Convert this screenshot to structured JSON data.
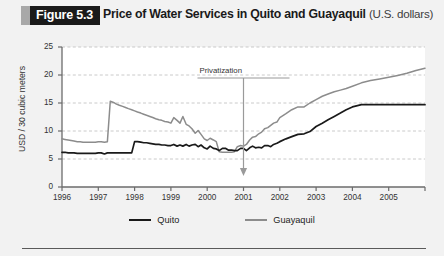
{
  "figure": {
    "tag": "Figure 5.3",
    "title": "Price of Water Services in Quito and Guayaquil",
    "title_units": "(U.S. dollars)"
  },
  "colors": {
    "quito": "#1a1a1a",
    "guayaquil": "#8c8c8c",
    "grid": "#bdbdbd",
    "axis": "#6b6b6b",
    "plot_background": "#ffffff",
    "figure_background": "#f2f2f2",
    "tag_background": "#1a1a1a",
    "tag_accent": "#a8a8a8"
  },
  "legend": {
    "position": "bottom-center",
    "items": [
      {
        "label": "Quito",
        "color": "#1a1a1a"
      },
      {
        "label": "Guayaquil",
        "color": "#8c8c8c"
      }
    ]
  },
  "annotations": [
    {
      "text": "Privatization",
      "x": 2001.0,
      "arrow": "down"
    }
  ],
  "chart_data": {
    "type": "line",
    "title": "Price of Water Services in Quito and Guayaquil (U.S. dollars)",
    "xlabel": "",
    "ylabel": "USD / 30 cubic meters",
    "xlim": [
      1996,
      2006
    ],
    "ylim": [
      0,
      25
    ],
    "yticks": [
      0,
      5,
      10,
      15,
      20,
      25
    ],
    "ytick_labels": [
      "0",
      "5",
      "10",
      "15",
      "20",
      "25"
    ],
    "xticks": [
      1996,
      1997,
      1998,
      1999,
      2000,
      2001,
      2002,
      2003,
      2004,
      2005
    ],
    "xtick_labels": [
      "1996",
      "1997",
      "1998",
      "1999",
      "2000",
      "2001",
      "2002",
      "2003",
      "2004",
      "2005"
    ],
    "grid": "horizontal",
    "series": [
      {
        "name": "Quito",
        "color": "#1a1a1a",
        "x": [
          1996.0,
          1996.08,
          1996.17,
          1996.25,
          1996.33,
          1996.42,
          1996.5,
          1996.58,
          1996.67,
          1996.75,
          1996.83,
          1996.92,
          1997.0,
          1997.08,
          1997.17,
          1997.25,
          1997.33,
          1997.42,
          1997.5,
          1997.58,
          1997.67,
          1997.75,
          1997.83,
          1997.92,
          1998.0,
          1998.08,
          1998.17,
          1998.25,
          1998.33,
          1998.42,
          1998.5,
          1998.58,
          1998.67,
          1998.75,
          1998.83,
          1998.92,
          1999.0,
          1999.08,
          1999.17,
          1999.25,
          1999.33,
          1999.42,
          1999.5,
          1999.58,
          1999.67,
          1999.75,
          1999.83,
          1999.92,
          2000.0,
          2000.08,
          2000.17,
          2000.25,
          2000.33,
          2000.42,
          2000.5,
          2000.58,
          2000.67,
          2000.75,
          2000.83,
          2000.92,
          2001.0,
          2001.08,
          2001.17,
          2001.25,
          2001.33,
          2001.42,
          2001.5,
          2001.58,
          2001.67,
          2001.75,
          2001.83,
          2001.92,
          2002.0,
          2002.17,
          2002.33,
          2002.5,
          2002.67,
          2002.83,
          2003.0,
          2003.17,
          2003.33,
          2003.5,
          2003.67,
          2003.83,
          2004.0,
          2004.25,
          2004.5,
          2004.75,
          2005.0,
          2005.25,
          2005.5,
          2005.75,
          2006.0
        ],
        "y": [
          6.2,
          6.2,
          6.1,
          6.1,
          6.1,
          6.0,
          6.0,
          6.0,
          6.0,
          6.0,
          6.0,
          6.0,
          6.1,
          6.1,
          5.9,
          6.1,
          6.1,
          6.1,
          6.1,
          6.1,
          6.1,
          6.1,
          6.1,
          6.1,
          8.1,
          8.1,
          8.0,
          7.9,
          7.9,
          7.8,
          7.7,
          7.6,
          7.6,
          7.5,
          7.5,
          7.4,
          7.4,
          7.6,
          7.3,
          7.5,
          7.3,
          7.6,
          7.3,
          7.5,
          7.6,
          7.2,
          7.5,
          7.0,
          6.8,
          7.3,
          6.9,
          6.8,
          6.5,
          6.9,
          6.9,
          6.6,
          6.6,
          6.5,
          6.5,
          6.9,
          6.9,
          6.5,
          7.0,
          7.3,
          7.0,
          7.1,
          7.0,
          7.4,
          7.4,
          7.2,
          7.6,
          7.8,
          8.1,
          8.6,
          9.0,
          9.4,
          9.5,
          9.9,
          10.8,
          11.4,
          12.0,
          12.6,
          13.2,
          13.8,
          14.3,
          14.7,
          14.7,
          14.7,
          14.7,
          14.7,
          14.7,
          14.7,
          14.7
        ]
      },
      {
        "name": "Guayaquil",
        "color": "#8c8c8c",
        "x": [
          1996.0,
          1996.08,
          1996.17,
          1996.25,
          1996.33,
          1996.42,
          1996.5,
          1996.58,
          1996.67,
          1996.75,
          1996.83,
          1996.92,
          1997.0,
          1997.08,
          1997.17,
          1997.25,
          1997.33,
          1997.42,
          1997.5,
          1997.58,
          1997.67,
          1997.75,
          1997.83,
          1997.92,
          1998.0,
          1998.08,
          1998.17,
          1998.25,
          1998.33,
          1998.42,
          1998.5,
          1998.58,
          1998.67,
          1998.75,
          1998.83,
          1998.92,
          1999.0,
          1999.08,
          1999.17,
          1999.25,
          1999.33,
          1999.42,
          1999.5,
          1999.58,
          1999.67,
          1999.75,
          1999.83,
          1999.92,
          2000.0,
          2000.08,
          2000.17,
          2000.25,
          2000.33,
          2000.42,
          2000.5,
          2000.58,
          2000.67,
          2000.75,
          2000.83,
          2000.92,
          2001.0,
          2001.08,
          2001.17,
          2001.25,
          2001.33,
          2001.42,
          2001.5,
          2001.58,
          2001.67,
          2001.75,
          2001.83,
          2001.92,
          2002.0,
          2002.17,
          2002.33,
          2002.5,
          2002.67,
          2002.83,
          2003.0,
          2003.17,
          2003.33,
          2003.5,
          2003.67,
          2003.83,
          2004.0,
          2004.25,
          2004.5,
          2004.75,
          2005.0,
          2005.25,
          2005.5,
          2005.75,
          2006.0
        ],
        "y": [
          8.6,
          8.5,
          8.4,
          8.3,
          8.2,
          8.1,
          8.1,
          8.0,
          8.0,
          8.0,
          8.0,
          8.0,
          8.1,
          8.1,
          8.0,
          8.1,
          15.3,
          15.1,
          14.8,
          14.6,
          14.4,
          14.2,
          14.0,
          13.8,
          13.6,
          13.4,
          13.2,
          13.0,
          12.8,
          12.6,
          12.4,
          12.2,
          12.0,
          11.9,
          11.7,
          11.6,
          11.4,
          12.4,
          11.9,
          11.4,
          12.6,
          11.2,
          10.9,
          10.4,
          9.6,
          10.1,
          9.4,
          8.6,
          8.3,
          8.7,
          8.4,
          8.1,
          6.3,
          6.2,
          6.2,
          6.2,
          6.2,
          6.3,
          7.2,
          7.4,
          7.3,
          7.6,
          8.4,
          8.9,
          9.0,
          9.5,
          9.8,
          10.4,
          10.6,
          11.0,
          11.4,
          11.6,
          12.4,
          13.1,
          13.8,
          14.3,
          14.3,
          15.0,
          15.6,
          16.2,
          16.6,
          17.0,
          17.3,
          17.6,
          18.0,
          18.6,
          19.0,
          19.3,
          19.6,
          19.9,
          20.3,
          20.8,
          21.2
        ]
      }
    ]
  }
}
